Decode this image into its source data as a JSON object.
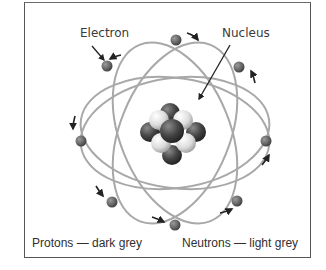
{
  "diagram": {
    "labels": {
      "electron": "Electron",
      "nucleus": "Nucleus"
    },
    "legend": {
      "protons": "Protons — dark grey",
      "neutrons": "Neutrons — light grey"
    },
    "colors": {
      "frame": "#555555",
      "orbit": "#a8a8a8",
      "electron": "#6e6e6e",
      "proton": "#4a4a4a",
      "neutron": "#d8d8d8",
      "arrow": "#222222",
      "text": "#333333"
    },
    "electron_count": 8,
    "orbit_count": 4
  }
}
